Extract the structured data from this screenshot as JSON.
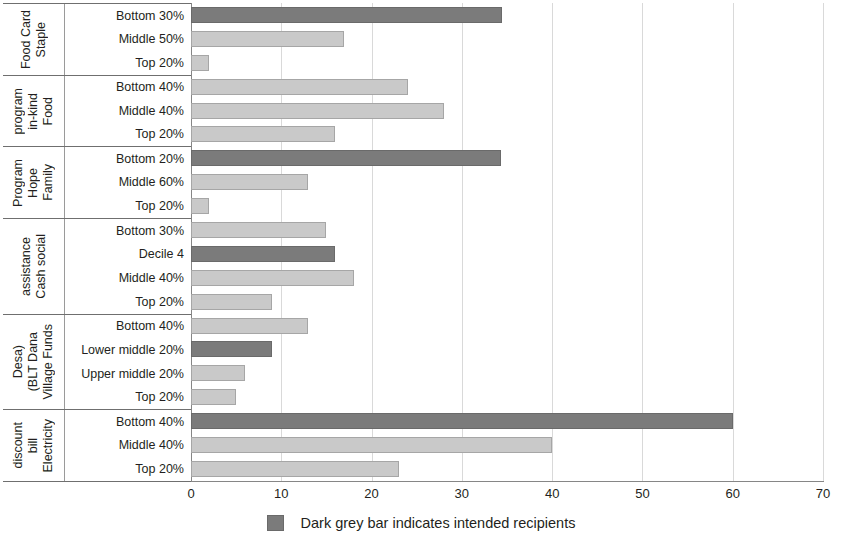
{
  "chart_data": {
    "type": "bar",
    "orientation": "horizontal",
    "title": "",
    "xlabel": "",
    "ylabel": "",
    "xlim": [
      0,
      70
    ],
    "xticks": [
      0,
      10,
      20,
      30,
      40,
      50,
      60,
      70
    ],
    "grid": true,
    "legend": {
      "position": "bottom-center",
      "entries": [
        {
          "label": "Dark grey bar indicates intended recipients",
          "color": "#7b7b7b"
        }
      ]
    },
    "colors": {
      "dark_grey": "#7b7b7b",
      "light_grey": "#c9c9c9",
      "axis": "#868686",
      "gridline": "#d9d9d9",
      "text": "#231f20"
    },
    "groups": [
      {
        "name": "Staple Food Card",
        "bars": [
          {
            "label": "Bottom 30%",
            "value": 34.5,
            "shade": "dark"
          },
          {
            "label": "Middle 50%",
            "value": 17.0,
            "shade": "light"
          },
          {
            "label": "Top 20%",
            "value": 2.0,
            "shade": "light"
          }
        ]
      },
      {
        "name": "Food in-kind program",
        "bars": [
          {
            "label": "Bottom 40%",
            "value": 24.0,
            "shade": "light"
          },
          {
            "label": "Middle 40%",
            "value": 28.0,
            "shade": "light"
          },
          {
            "label": "Top 20%",
            "value": 16.0,
            "shade": "light"
          }
        ]
      },
      {
        "name": "Family Hope Program",
        "bars": [
          {
            "label": "Bottom 20%",
            "value": 34.3,
            "shade": "dark"
          },
          {
            "label": "Middle 60%",
            "value": 13.0,
            "shade": "light"
          },
          {
            "label": "Top 20%",
            "value": 2.0,
            "shade": "light"
          }
        ]
      },
      {
        "name": "Cash social assistance",
        "bars": [
          {
            "label": "Bottom 30%",
            "value": 15.0,
            "shade": "light"
          },
          {
            "label": "Decile 4",
            "value": 16.0,
            "shade": "dark"
          },
          {
            "label": "Middle 40%",
            "value": 18.0,
            "shade": "light"
          },
          {
            "label": "Top 20%",
            "value": 9.0,
            "shade": "light"
          }
        ]
      },
      {
        "name": "Village Funds (BLT Dana Desa)",
        "bars": [
          {
            "label": "Bottom 40%",
            "value": 13.0,
            "shade": "light"
          },
          {
            "label": "Lower middle 20%",
            "value": 9.0,
            "shade": "dark"
          },
          {
            "label": "Upper middle 20%",
            "value": 6.0,
            "shade": "light"
          },
          {
            "label": "Top 20%",
            "value": 5.0,
            "shade": "light"
          }
        ]
      },
      {
        "name": "Electricity bill discount",
        "bars": [
          {
            "label": "Bottom 40%",
            "value": 60.0,
            "shade": "dark"
          },
          {
            "label": "Middle 40%",
            "value": 40.0,
            "shade": "light"
          },
          {
            "label": "Top 20%",
            "value": 23.0,
            "shade": "light"
          }
        ]
      }
    ]
  },
  "group_title_lines": [
    [
      "Staple",
      "Food Card"
    ],
    [
      "Food",
      "in-kind",
      "program"
    ],
    [
      "Family",
      "Hope",
      "Program"
    ],
    [
      "Cash social",
      "assistance"
    ],
    [
      "Village Funds",
      "(BLT Dana",
      "Desa)"
    ],
    [
      "Electricity",
      "bill",
      "discount"
    ]
  ],
  "legend": {
    "text": "Dark grey bar indicates intended recipients"
  }
}
